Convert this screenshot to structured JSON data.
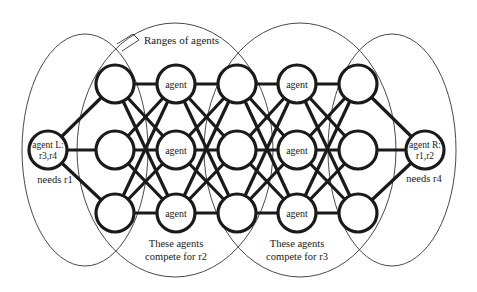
{
  "diagram": {
    "colors": {
      "stroke": "#1a1a1a",
      "background": "#ffffff",
      "range": "#333333"
    },
    "callout": {
      "label": "Ranges of agents"
    },
    "agent_left": {
      "label_line1": "agent L:",
      "label_line2": "r3,r4",
      "needs": "needs r1"
    },
    "agent_right": {
      "label_line1": "agent R:",
      "label_line2": "r1,r2",
      "needs": "needs r4"
    },
    "node_label": "agent",
    "columns": [
      {
        "x": 115,
        "nodes": [
          "",
          "",
          ""
        ]
      },
      {
        "x": 176,
        "nodes": [
          "agent",
          "agent",
          "agent"
        ]
      },
      {
        "x": 237,
        "nodes": [
          "",
          "",
          ""
        ]
      },
      {
        "x": 297,
        "nodes": [
          "agent",
          "agent",
          "agent"
        ]
      },
      {
        "x": 358,
        "nodes": [
          "",
          "",
          ""
        ]
      }
    ],
    "rows_y": [
      84,
      150,
      213
    ],
    "compete_groups": [
      {
        "line1": "These agents",
        "line2": "compete for r2"
      },
      {
        "line1": "These agents",
        "line2": "compete for r3"
      }
    ]
  }
}
